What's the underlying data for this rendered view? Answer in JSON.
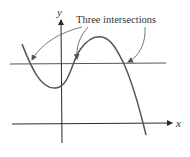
{
  "diagram": {
    "annotation": "Three intersections",
    "x_axis_label": "x",
    "y_axis_label": "y",
    "colors": {
      "axes": "#2a2a2a",
      "curve": "#555555",
      "horizontal_line": "#555555",
      "arrows": "#555555",
      "text": "#333333"
    },
    "intersections": [
      {
        "x": 30,
        "y": 63
      },
      {
        "x": 77,
        "y": 63
      },
      {
        "x": 124,
        "y": 63
      }
    ]
  }
}
